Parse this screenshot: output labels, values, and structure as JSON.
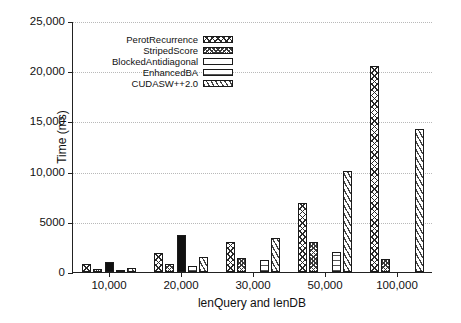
{
  "chart_data": {
    "type": "bar",
    "title": "",
    "xlabel": "lenQuery and lenDB",
    "ylabel": "Time (ms)",
    "categories": [
      "10,000",
      "20,000",
      "30,000",
      "50,000",
      "100,000"
    ],
    "ylim": [
      0,
      25000
    ],
    "yticks": [
      0,
      5000,
      10000,
      15000,
      20000,
      25000
    ],
    "ytick_labels": [
      "0",
      "5000",
      "10,000",
      "15,000",
      "20,000",
      "25,000"
    ],
    "grid": true,
    "legend_position": "upper-center",
    "series": [
      {
        "name": "PerotRecurrence",
        "pattern": "crosshatch-open",
        "values": [
          800,
          1900,
          3000,
          6900,
          20500
        ]
      },
      {
        "name": "StripedScore",
        "pattern": "crosshatch-dense",
        "values": [
          300,
          800,
          1400,
          3000,
          1300
        ]
      },
      {
        "name": "BlockedAntidiagonal",
        "pattern": "solid-black",
        "values": [
          1000,
          3700,
          0,
          0,
          0
        ]
      },
      {
        "name": "EnhancedBA",
        "pattern": "horizontal-lines",
        "values": [
          100,
          600,
          1200,
          2000,
          0
        ]
      },
      {
        "name": "CUDASW++2.0",
        "pattern": "diagonal-lines",
        "values": [
          400,
          1500,
          3400,
          10100,
          14200
        ]
      }
    ]
  },
  "legend": {
    "entries": [
      {
        "label": "PerotRecurrence"
      },
      {
        "label": "StripedScore"
      },
      {
        "label": "BlockedAntidiagonal"
      },
      {
        "label": "EnhancedBA"
      },
      {
        "label": "CUDASW++2.0"
      }
    ]
  }
}
